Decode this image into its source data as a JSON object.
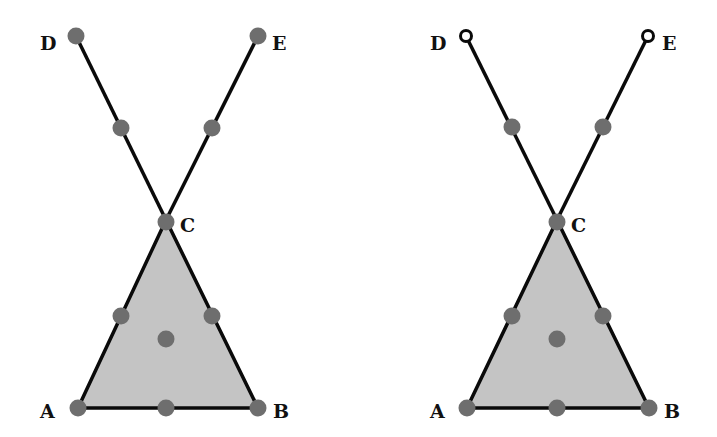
{
  "diagrams": [
    {
      "id": "left",
      "offset_x": 0,
      "labels": {
        "A": "A",
        "B": "B",
        "C": "C",
        "D": "D",
        "E": "E"
      },
      "endpoint_style": "filled"
    },
    {
      "id": "right",
      "offset_x": 390,
      "labels": {
        "A": "A",
        "B": "B",
        "C": "C",
        "D": "D",
        "E": "E"
      },
      "endpoint_style": "open"
    }
  ],
  "colors": {
    "fill": "#c4c4c4",
    "node": "#6e6e6e",
    "edge": "#0a0a0a"
  }
}
